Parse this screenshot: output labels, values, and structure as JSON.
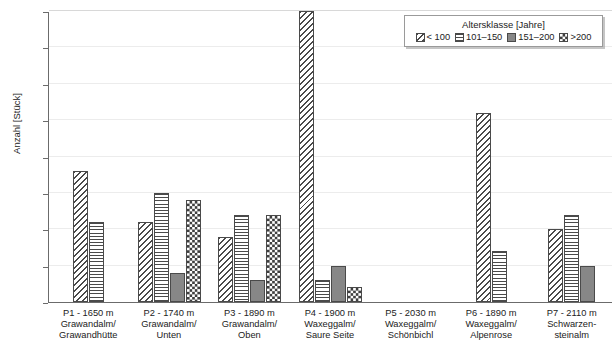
{
  "chart_data": {
    "type": "bar",
    "title": "",
    "xlabel": "",
    "ylabel": "Anzahl [Stück]",
    "ylim": [
      0,
      40
    ],
    "yticks": [
      0,
      5,
      10,
      15,
      20,
      25,
      30,
      35,
      40
    ],
    "grid": true,
    "legend": {
      "title": "Altersklasse [Jahre]",
      "position": "top-right",
      "entries": [
        "< 100",
        "101–150",
        "151–200",
        ">200"
      ]
    },
    "categories": [
      "P1 - 1650 m\nGrawandalm/\nGrawandhütte",
      "P2 - 1740 m\nGrawandalm/\nUnten",
      "P3 - 1890 m\nGrawandalm/\nOben",
      "P4 - 1900 m\nWaxeggalm/\nSaure Seite",
      "P5 - 2030 m\nWaxeggalm/\nSchönbichl",
      "P6 - 1890 m\nWaxeggalm/\nAlpenrose",
      "P7 - 2110 m\nSchwarzen-\nsteinalm"
    ],
    "category_lines": [
      [
        "P1 - 1650 m",
        "Grawandalm/",
        "Grawandhütte"
      ],
      [
        "P2 - 1740 m",
        "Grawandalm/",
        "Unten"
      ],
      [
        "P3 - 1890 m",
        "Grawandalm/",
        "Oben"
      ],
      [
        "P4 - 1900 m",
        "Waxeggalm/",
        "Saure Seite"
      ],
      [
        "P5 - 2030 m",
        "Waxeggalm/",
        "Schönbichl"
      ],
      [
        "P6 - 1890 m",
        "Waxeggalm/",
        "Alpenrose"
      ],
      [
        "P7 - 2110 m",
        "Schwarzen-",
        "steinalm"
      ]
    ],
    "series": [
      {
        "name": "< 100",
        "pattern": "diagonal-hatch",
        "values": [
          18,
          11,
          9,
          40,
          0,
          26,
          10
        ]
      },
      {
        "name": "101–150",
        "pattern": "horizontal-lines",
        "values": [
          11,
          15,
          12,
          3,
          0,
          7,
          12
        ]
      },
      {
        "name": "151–200",
        "pattern": "solid-gray",
        "values": [
          0,
          4,
          3,
          5,
          0,
          0,
          5
        ]
      },
      {
        "name": ">200",
        "pattern": "checkerboard",
        "values": [
          0,
          14,
          12,
          2,
          0,
          0,
          0
        ]
      }
    ]
  },
  "colors": {
    "hatch": "#4a4a4a",
    "solid_gray": "#878787",
    "axis": "#6b6b6b",
    "gridline": "#ececec",
    "text": "#222222",
    "background": "#ffffff"
  }
}
